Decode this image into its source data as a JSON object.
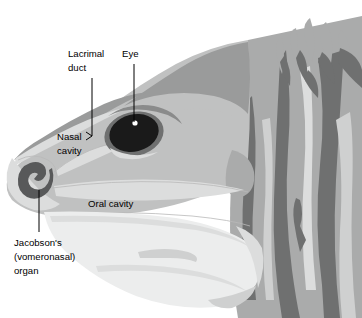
{
  "figure": {
    "background_color": "#ffffff",
    "width": 362,
    "height": 318
  },
  "palette": {
    "white": "#ffffff",
    "very_light_gray": "#eceded",
    "light_gray": "#dcdddd",
    "pale_gray": "#cfd0d0",
    "mid_light_gray": "#c0c1c1",
    "mid_gray": "#aaabab",
    "gray": "#9a9b9b",
    "dark_mid_gray": "#8a8b8b",
    "dark_gray": "#6f7070",
    "darker_gray": "#58595a",
    "near_black": "#2b2b2b",
    "black": "#1a1a1a",
    "outline": "#b9b9b9",
    "leader_line": "#000000",
    "text": "#000000"
  },
  "labels": [
    {
      "id": "lacrimal-duct",
      "lines": [
        "Lacrimal",
        "duct"
      ],
      "text_x": 68,
      "text_y": 56,
      "anchor": "start",
      "leader": "M 92 78 L 92 136",
      "arrow": true
    },
    {
      "id": "eye",
      "lines": [
        "Eye"
      ],
      "text_x": 124,
      "text_y": 56,
      "anchor": "start",
      "leader": "M 134 64 L 134 122",
      "arrow": false
    },
    {
      "id": "nasal-cavity",
      "lines": [
        "Nasal",
        "cavity"
      ],
      "text_x": 57,
      "text_y": 139,
      "anchor": "start",
      "leader": "",
      "arrow": false
    },
    {
      "id": "oral-cavity",
      "lines": [
        "Oral cavity"
      ],
      "text_x": 88,
      "text_y": 204,
      "anchor": "start",
      "leader": "",
      "arrow": false
    },
    {
      "id": "jacobsons-organ",
      "lines": [
        "Jacobson's",
        "(vomeronasal)",
        "organ"
      ],
      "text_x": 14,
      "text_y": 243,
      "anchor": "start",
      "leader": "M 39 190 L 39 232",
      "arrow": false
    }
  ],
  "structures": [
    {
      "id": "head-outline",
      "name": "lizard head silhouette"
    },
    {
      "id": "eye-globe",
      "name": "eye",
      "fill": "#1a1a1a"
    },
    {
      "id": "eye-highlight",
      "name": "eye specular highlight",
      "fill": "#ffffff"
    },
    {
      "id": "eye-socket-ring",
      "name": "orbital ring",
      "fill": "#6f7070"
    },
    {
      "id": "jacobsons-spiral",
      "name": "vomeronasal organ spiral",
      "fill": "#58595a"
    },
    {
      "id": "nasal-passage",
      "name": "nasal cavity passage"
    },
    {
      "id": "oral-cavity-region",
      "name": "oral cavity"
    },
    {
      "id": "lower-jaw",
      "name": "lower jaw and throat"
    },
    {
      "id": "nuchal-crest",
      "name": "nuchal crest spines"
    },
    {
      "id": "neck-scales",
      "name": "neck scale pattern"
    }
  ]
}
